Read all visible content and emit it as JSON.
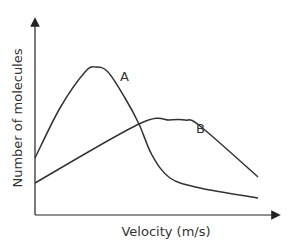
{
  "chart_data": {
    "type": "line",
    "title": "",
    "xlabel": "Velocity (m/s)",
    "ylabel": "Number of molecules",
    "grid": false,
    "legend": "inline labels on curves",
    "axis_ticks": "none",
    "series": [
      {
        "name": "A",
        "label_position": "right of peak, on descending side",
        "description": "Narrow, high peak at low velocity; drops steeply then tails off",
        "points_px": [
          [
            35,
            158
          ],
          [
            60,
            108
          ],
          [
            85,
            72
          ],
          [
            96,
            67
          ],
          [
            108,
            72
          ],
          [
            125,
            98
          ],
          [
            139,
            124
          ],
          [
            152,
            155
          ],
          [
            170,
            178
          ],
          [
            200,
            188
          ],
          [
            258,
            198
          ]
        ]
      },
      {
        "name": "B",
        "label_position": "right of peak",
        "description": "Broad, lower peak at higher velocity",
        "points_px": [
          [
            35,
            183
          ],
          [
            139,
            124
          ],
          [
            170,
            120
          ],
          [
            185,
            120
          ],
          [
            200,
            126
          ],
          [
            258,
            177
          ]
        ]
      }
    ],
    "axes": {
      "origin_px": [
        35,
        215
      ],
      "y_top_px": 18,
      "x_right_px": 280
    },
    "line_color": "#333333"
  }
}
